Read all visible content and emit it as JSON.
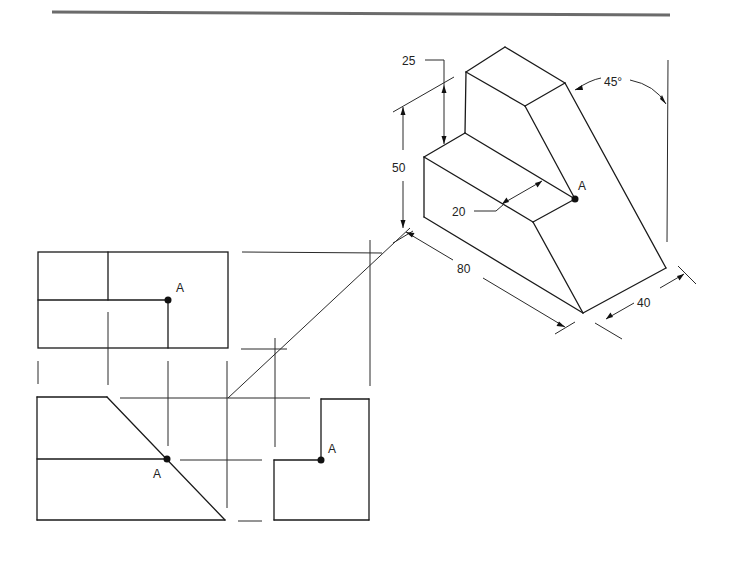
{
  "figure": {
    "type": "orthographic projection with isometric view",
    "isometric": {
      "dimensions": {
        "height_total": "50",
        "step_height": "25",
        "step_depth": "20",
        "length": "80",
        "width": "40",
        "angle": "45°"
      },
      "point_label": "A"
    },
    "views": {
      "top": {
        "point_label": "A"
      },
      "front": {
        "point_label": "A"
      },
      "side": {
        "point_label": "A"
      }
    }
  },
  "colors": {
    "line": "#1a1a1a",
    "rule": "#6b6b6b",
    "background": "#ffffff"
  }
}
